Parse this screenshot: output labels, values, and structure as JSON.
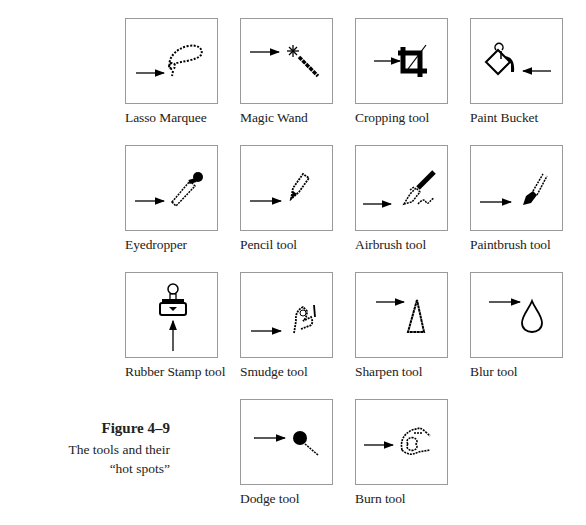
{
  "figure": {
    "title": "Figure 4–9",
    "caption_line1": "The tools and their",
    "caption_line2": "“hot spots”"
  },
  "tools": [
    {
      "label": "Lasso Marquee",
      "icon": "lasso-icon"
    },
    {
      "label": "Magic Wand",
      "icon": "magic-wand-icon"
    },
    {
      "label": "Cropping tool",
      "icon": "crop-icon"
    },
    {
      "label": "Paint Bucket",
      "icon": "paint-bucket-icon"
    },
    {
      "label": "Eyedropper",
      "icon": "eyedropper-icon"
    },
    {
      "label": "Pencil tool",
      "icon": "pencil-icon"
    },
    {
      "label": "Airbrush tool",
      "icon": "airbrush-icon"
    },
    {
      "label": "Paintbrush tool",
      "icon": "paintbrush-icon"
    },
    {
      "label": "Rubber Stamp tool",
      "icon": "rubber-stamp-icon"
    },
    {
      "label": "Smudge tool",
      "icon": "smudge-icon"
    },
    {
      "label": "Sharpen tool",
      "icon": "sharpen-icon"
    },
    {
      "label": "Blur tool",
      "icon": "blur-icon"
    },
    {
      "label": "Dodge tool",
      "icon": "dodge-icon"
    },
    {
      "label": "Burn tool",
      "icon": "burn-icon"
    }
  ]
}
